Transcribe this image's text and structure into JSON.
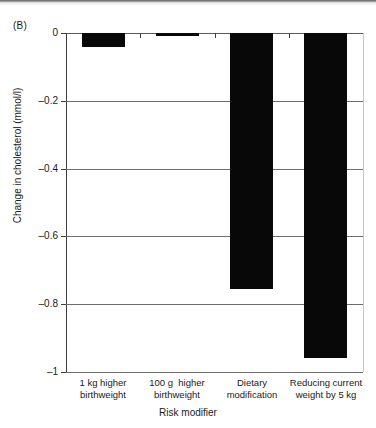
{
  "panel": {
    "label": "(B)"
  },
  "chart_data": {
    "type": "bar",
    "title": "",
    "subtitle": "",
    "xlabel": "Risk modifier",
    "ylabel": "Change in cholesterol (mmol/l)",
    "categories": [
      "1 kg higher\nbirthweight",
      "100 g  higher\nbirthweight",
      "Dietary\nmodification",
      "Reducing current\nweight by 5 kg"
    ],
    "values": [
      -0.04,
      -0.01,
      -0.755,
      -0.96
    ],
    "ylim": [
      -1,
      0
    ],
    "yticks": [
      0,
      -0.2,
      -0.4,
      -0.6,
      -0.8,
      -1
    ],
    "ytick_labels": [
      "0",
      "–0.2",
      "–0.4",
      "–0.6",
      "–0.8",
      "–1"
    ],
    "grid": true,
    "grid_axis": "y",
    "legend": false,
    "bar_color": "#080808",
    "orientation": "vertical"
  }
}
